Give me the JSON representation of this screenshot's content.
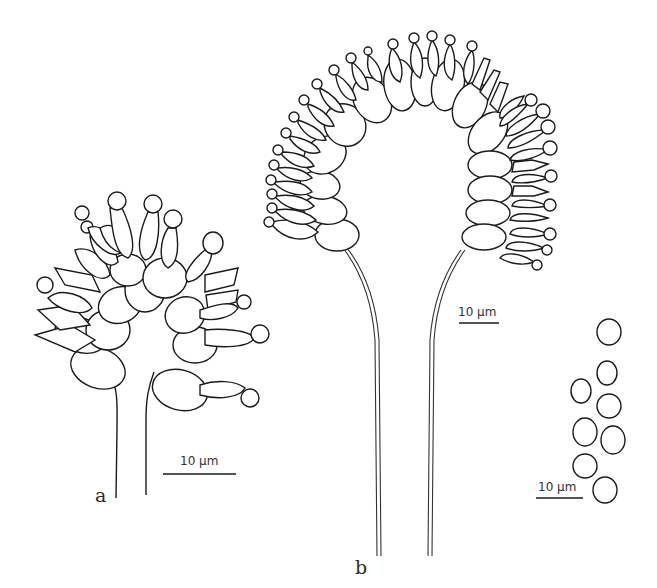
{
  "figure": {
    "panels": [
      {
        "id": "a",
        "label": "a",
        "description": "conidiophore with branched head"
      },
      {
        "id": "b",
        "label": "b",
        "description": "conidiophore with arched head of phialides"
      },
      {
        "id": "c",
        "label": "",
        "description": "conidia"
      }
    ],
    "scale_bars": [
      {
        "panel": "a",
        "text": "10 µm"
      },
      {
        "panel": "b",
        "text": "10 µm"
      },
      {
        "panel": "c",
        "text": "10 µm"
      }
    ],
    "colors": {
      "ink": "#1a1a1a",
      "background": "#ffffff"
    }
  }
}
